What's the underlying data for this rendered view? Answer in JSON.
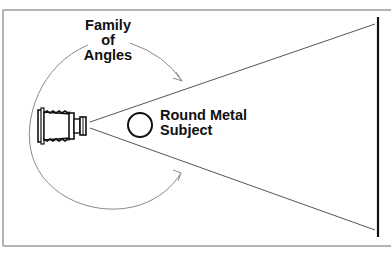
{
  "diagram": {
    "title_label": [
      "Family",
      "of",
      "Angles"
    ],
    "subject_label": [
      "Round Metal",
      "Subject"
    ],
    "elements": {
      "camera": "view-camera-icon",
      "subject": "round-metal-subject-circle",
      "background": "vertical-background-line",
      "arrows": [
        "family-of-angles-arc-upper",
        "family-of-angles-arc-lower"
      ]
    },
    "colors": {
      "frame": "#9a9a9a",
      "lines": "#555555",
      "arc": "#8a8a8a",
      "ink": "#111111"
    }
  }
}
